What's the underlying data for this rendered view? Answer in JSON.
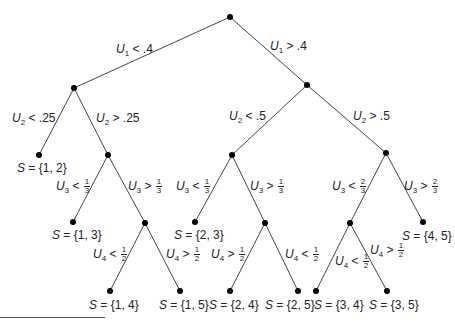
{
  "diagram": {
    "type": "decision-tree",
    "colors": {
      "line": "#444444",
      "node": "#000000",
      "text": "#222222"
    },
    "nodes": [
      {
        "id": "root",
        "x": 230,
        "y": 17
      },
      {
        "id": "a",
        "x": 74,
        "y": 88
      },
      {
        "id": "b",
        "x": 307,
        "y": 85
      },
      {
        "id": "a1",
        "x": 39,
        "y": 155
      },
      {
        "id": "a2",
        "x": 108,
        "y": 155
      },
      {
        "id": "b1",
        "x": 232,
        "y": 155
      },
      {
        "id": "b2",
        "x": 386,
        "y": 153
      },
      {
        "id": "a21",
        "x": 73,
        "y": 222
      },
      {
        "id": "a22",
        "x": 145,
        "y": 223
      },
      {
        "id": "b11",
        "x": 195,
        "y": 222
      },
      {
        "id": "b12",
        "x": 265,
        "y": 223
      },
      {
        "id": "b21",
        "x": 350,
        "y": 223
      },
      {
        "id": "b22",
        "x": 423,
        "y": 222
      },
      {
        "id": "a221",
        "x": 110,
        "y": 291
      },
      {
        "id": "a222",
        "x": 180,
        "y": 291
      },
      {
        "id": "b121",
        "x": 230,
        "y": 291
      },
      {
        "id": "b122",
        "x": 298,
        "y": 291
      },
      {
        "id": "b211",
        "x": 316,
        "y": 291
      },
      {
        "id": "b212",
        "x": 387,
        "y": 291
      }
    ],
    "edges": [
      [
        "root",
        "a"
      ],
      [
        "root",
        "b"
      ],
      [
        "a",
        "a1"
      ],
      [
        "a",
        "a2"
      ],
      [
        "b",
        "b1"
      ],
      [
        "b",
        "b2"
      ],
      [
        "a2",
        "a21"
      ],
      [
        "a2",
        "a22"
      ],
      [
        "b1",
        "b11"
      ],
      [
        "b1",
        "b12"
      ],
      [
        "b2",
        "b21"
      ],
      [
        "b2",
        "b22"
      ],
      [
        "a22",
        "a221"
      ],
      [
        "a22",
        "a222"
      ],
      [
        "b12",
        "b121"
      ],
      [
        "b12",
        "b122"
      ],
      [
        "b21",
        "b211"
      ],
      [
        "b21",
        "b212"
      ]
    ],
    "edge_labels": [
      {
        "id": "u1-lt",
        "var": "U",
        "sub": "1",
        "op": "<",
        "value": ".4",
        "x": 116,
        "y": 42
      },
      {
        "id": "u1-gt",
        "var": "U",
        "sub": "1",
        "op": ">",
        "value": ".4",
        "x": 270,
        "y": 39
      },
      {
        "id": "u2-lt-25",
        "var": "U",
        "sub": "2",
        "op": "<",
        "value": ".25",
        "x": 12,
        "y": 111
      },
      {
        "id": "u2-gt-25",
        "var": "U",
        "sub": "2",
        "op": ">",
        "value": ".25",
        "x": 96,
        "y": 111
      },
      {
        "id": "u2-lt-5",
        "var": "U",
        "sub": "2",
        "op": "<",
        "value": ".5",
        "x": 229,
        "y": 109
      },
      {
        "id": "u2-gt-5",
        "var": "U",
        "sub": "2",
        "op": ">",
        "value": ".5",
        "x": 353,
        "y": 109
      },
      {
        "id": "u3-lt-13a",
        "var": "U",
        "sub": "3",
        "op": "<",
        "num": "1",
        "den": "3",
        "x": 56,
        "y": 178
      },
      {
        "id": "u3-gt-13a",
        "var": "U",
        "sub": "3",
        "op": ">",
        "num": "1",
        "den": "3",
        "x": 128,
        "y": 178
      },
      {
        "id": "u3-lt-13b",
        "var": "U",
        "sub": "3",
        "op": "<",
        "num": "1",
        "den": "3",
        "x": 176,
        "y": 178
      },
      {
        "id": "u3-gt-13b",
        "var": "U",
        "sub": "3",
        "op": ">",
        "num": "1",
        "den": "3",
        "x": 250,
        "y": 178
      },
      {
        "id": "u3-lt-23",
        "var": "U",
        "sub": "3",
        "op": "<",
        "num": "2",
        "den": "3",
        "x": 332,
        "y": 178
      },
      {
        "id": "u3-gt-23",
        "var": "U",
        "sub": "3",
        "op": ">",
        "num": "2",
        "den": "3",
        "x": 404,
        "y": 178
      },
      {
        "id": "u4-lt-12a",
        "var": "U",
        "sub": "4",
        "op": "<",
        "num": "1",
        "den": "2",
        "x": 93,
        "y": 246
      },
      {
        "id": "u4-gt-12a",
        "var": "U",
        "sub": "4",
        "op": ">",
        "num": "1",
        "den": "2",
        "x": 166,
        "y": 246
      },
      {
        "id": "u4-gt-12b",
        "var": "U",
        "sub": "4",
        "op": ">",
        "num": "1",
        "den": "2",
        "x": 211,
        "y": 246
      },
      {
        "id": "u4-lt-12b",
        "var": "U",
        "sub": "4",
        "op": "<",
        "num": "1",
        "den": "2",
        "x": 285,
        "y": 246
      },
      {
        "id": "u4-lt-12c",
        "var": "U",
        "sub": "4",
        "op": "<",
        "num": "1",
        "den": "2",
        "x": 335,
        "y": 253
      },
      {
        "id": "u4-gt-12c",
        "var": "U",
        "sub": "4",
        "op": ">",
        "num": "1",
        "den": "2",
        "x": 370,
        "y": 242
      }
    ],
    "leaf_labels": [
      {
        "id": "leaf-12",
        "text": "{1, 2}",
        "x": 17,
        "y": 161
      },
      {
        "id": "leaf-13",
        "text": "{1, 3}",
        "x": 52,
        "y": 228
      },
      {
        "id": "leaf-23",
        "text": "{2, 3}",
        "x": 174,
        "y": 228
      },
      {
        "id": "leaf-45",
        "text": "{4, 5}",
        "x": 402,
        "y": 229
      },
      {
        "id": "leaf-14",
        "text": "{1, 4}",
        "x": 89,
        "y": 298
      },
      {
        "id": "leaf-15",
        "text": "{1, 5}",
        "x": 159,
        "y": 298
      },
      {
        "id": "leaf-24",
        "text": "{2, 4}",
        "x": 209,
        "y": 298
      },
      {
        "id": "leaf-25",
        "text": "{2, 5}",
        "x": 265,
        "y": 298
      },
      {
        "id": "leaf-34",
        "text": "{3, 4}",
        "x": 314,
        "y": 298
      },
      {
        "id": "leaf-35",
        "text": "{3, 5}",
        "x": 369,
        "y": 298
      }
    ],
    "set_var": "S",
    "set_eq": "="
  }
}
